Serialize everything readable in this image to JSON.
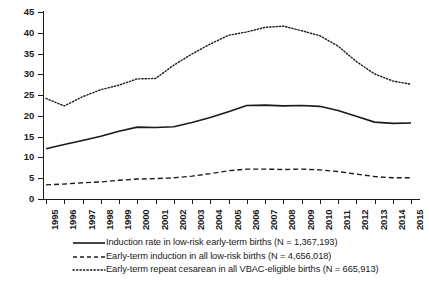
{
  "chart_data": {
    "type": "line",
    "title": "",
    "xlabel": "",
    "ylabel": "",
    "ylim": [
      0,
      45
    ],
    "ytick_step": 5,
    "grid": false,
    "legend_position": "bottom",
    "categories": [
      "1995",
      "1996",
      "1997",
      "1998",
      "1999",
      "2000",
      "2001",
      "2002",
      "2003",
      "2004",
      "2005",
      "2006",
      "2007",
      "2008",
      "2009",
      "2010",
      "2011",
      "2012",
      "2013",
      "2014",
      "2015"
    ],
    "yticks": [
      "0",
      "5",
      "10",
      "15",
      "20",
      "25",
      "30",
      "35",
      "40",
      "45"
    ],
    "series": [
      {
        "name": "Induction rate in low-risk early-term births (N = 1,367,193)",
        "style": "solid",
        "color": "#1a1a1a",
        "values": [
          12.1,
          13.1,
          14.1,
          15.1,
          16.3,
          17.3,
          17.2,
          17.4,
          18.4,
          19.6,
          21.0,
          22.5,
          22.6,
          22.4,
          22.5,
          22.3,
          21.3,
          19.9,
          18.5,
          18.2,
          18.3
        ]
      },
      {
        "name": "Early-term induction in all low-risk births (N = 4,656,018)",
        "style": "dashed",
        "color": "#1a1a1a",
        "values": [
          3.4,
          3.6,
          3.9,
          4.1,
          4.5,
          4.8,
          4.9,
          5.1,
          5.5,
          6.1,
          6.8,
          7.2,
          7.2,
          7.1,
          7.2,
          7.0,
          6.6,
          6.0,
          5.4,
          5.1,
          5.1
        ]
      },
      {
        "name": "Early-term repeat cesarean in all VBAC-eligible births (N = 665,913)",
        "style": "dotted",
        "color": "#1a1a1a",
        "values": [
          24.2,
          22.4,
          24.6,
          26.3,
          27.4,
          28.9,
          29.0,
          32.2,
          34.9,
          37.3,
          39.4,
          40.2,
          41.3,
          41.6,
          40.5,
          39.3,
          36.8,
          33.1,
          30.1,
          28.4,
          27.6
        ]
      }
    ]
  },
  "legend": {
    "items": [
      {
        "key": "solid-line-key",
        "label": "Induction rate in low-risk early-term births (N = 1,367,193)"
      },
      {
        "key": "dashed-line-key",
        "label": "Early-term induction in all low-risk births (N = 4,656,018)"
      },
      {
        "key": "dotted-line-key",
        "label": "Early-term repeat cesarean in all VBAC-eligible births (N = 665,913)"
      }
    ]
  }
}
